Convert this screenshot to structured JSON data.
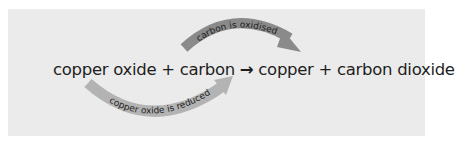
{
  "diagram": {
    "equation": {
      "reactant1": "copper oxide",
      "plus1": "+",
      "reactant2": "carbon",
      "arrow": "→",
      "product1": "copper",
      "plus2": "+",
      "product2": "carbon dioxide"
    },
    "top_arrow": {
      "label": "carbon is oxidised",
      "color": "#8a8a8a"
    },
    "bottom_arrow": {
      "label": "copper oxide is reduced",
      "color": "#b3b3b3"
    },
    "background_color": "#ebebeb"
  }
}
